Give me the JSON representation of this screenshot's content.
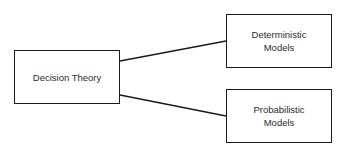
{
  "diagram": {
    "type": "tree",
    "root": {
      "id": "decision-theory",
      "label": "Decision Theory"
    },
    "children": [
      {
        "id": "deterministic-models",
        "label_line1": "Deterministic",
        "label_line2": "Models"
      },
      {
        "id": "probabilistic-models",
        "label_line1": "Probabilistic",
        "label_line2": "Models"
      }
    ],
    "edges": [
      {
        "from": "decision-theory",
        "to": "deterministic-models"
      },
      {
        "from": "decision-theory",
        "to": "probabilistic-models"
      }
    ],
    "colors": {
      "stroke": "#1a1a1a",
      "text": "#2b2b2b",
      "background": "#ffffff"
    }
  }
}
